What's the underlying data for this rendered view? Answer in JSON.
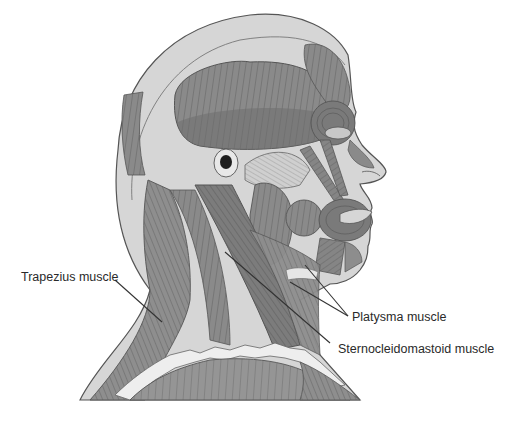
{
  "figure": {
    "colors": {
      "background": "#ffffff",
      "skin_light": "#d8d8d8",
      "skin_mid": "#c4c4c4",
      "muscle_light": "#9a9a9a",
      "muscle_mid": "#808080",
      "muscle_dark": "#666666",
      "outline": "#555555",
      "leader_line": "#333333",
      "label_text": "#2a2a2a"
    }
  },
  "labels": [
    {
      "id": "trapezius",
      "text": "Trapezius muscle"
    },
    {
      "id": "platysma",
      "text": "Platysma muscle"
    },
    {
      "id": "sternocleidomastoid",
      "text": "Sternocleidomastoid muscle"
    }
  ]
}
